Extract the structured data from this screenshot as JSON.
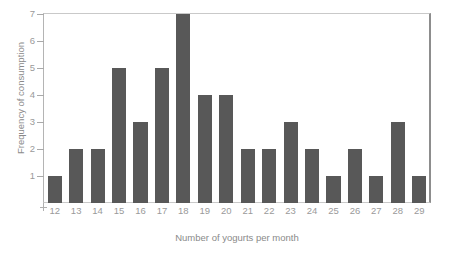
{
  "chart_data": {
    "type": "bar",
    "title": "",
    "xlabel": "Number of yogurts per month",
    "ylabel": "Frequency of consumption",
    "categories": [
      "12",
      "13",
      "14",
      "15",
      "16",
      "17",
      "18",
      "19",
      "20",
      "21",
      "22",
      "23",
      "24",
      "25",
      "26",
      "27",
      "28",
      "29"
    ],
    "values": [
      1,
      2,
      2,
      5,
      3,
      5,
      7,
      4,
      4,
      2,
      2,
      3,
      2,
      1,
      2,
      1,
      3,
      1
    ],
    "ylim": [
      0,
      7
    ],
    "yticks": [
      "1",
      "2",
      "3",
      "4",
      "5",
      "6",
      "7"
    ],
    "grid": false,
    "legend": null,
    "bar_color": "#585858",
    "axis_color": "#9a9a9a",
    "frame_color": "#c9c9c9"
  },
  "artifacts": {
    "top_clipped_text": ""
  }
}
